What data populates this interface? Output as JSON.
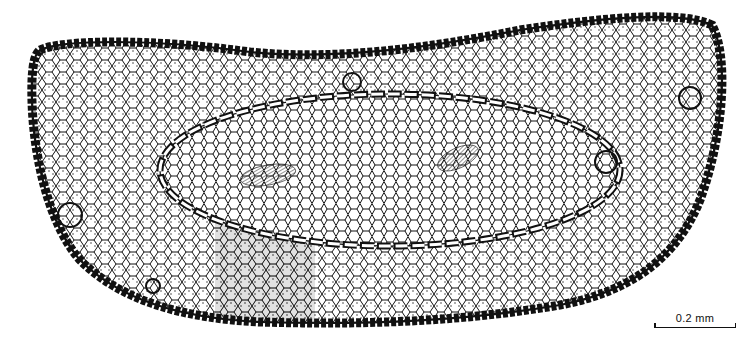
{
  "figure": {
    "scale_bar": {
      "label": "0.2 mm"
    },
    "colors": {
      "ink": "#111111",
      "background": "#ffffff",
      "shaded_region": "#dcdcdc"
    },
    "features": [
      "thick-walled epidermis outline",
      "lobed ground parenchyma",
      "elliptical endodermis ring",
      "left vascular bundle (hatched)",
      "right vascular bundle (hatched)",
      "grey shaded sector lower-left",
      "stomata / secretory cavities along margin"
    ]
  }
}
